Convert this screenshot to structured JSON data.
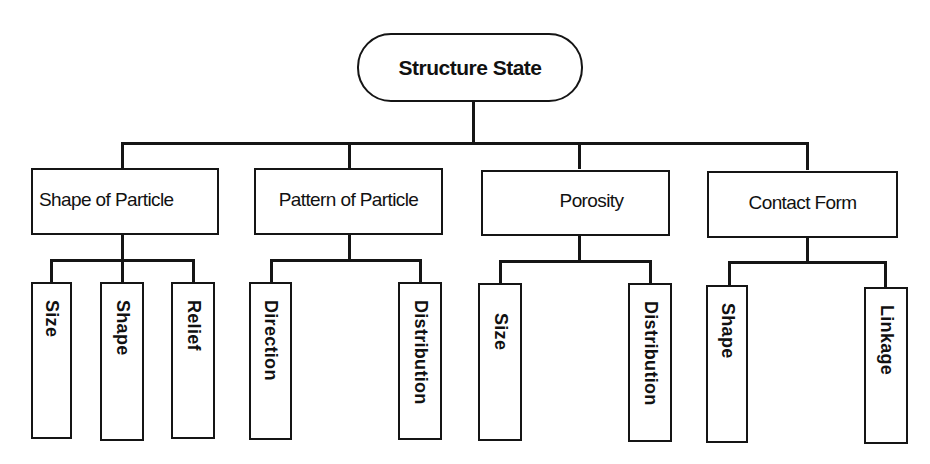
{
  "diagram": {
    "type": "hierarchy",
    "root": {
      "label": "Structure State"
    },
    "children": [
      {
        "label": "Shape of Particle",
        "children": [
          {
            "label": "Size"
          },
          {
            "label": "Shape"
          },
          {
            "label": "Relief"
          }
        ]
      },
      {
        "label": "Pattern of Particle",
        "children": [
          {
            "label": "Direction"
          },
          {
            "label": "Distribution"
          }
        ]
      },
      {
        "label": "Porosity",
        "children": [
          {
            "label": "Size"
          },
          {
            "label": "Distribution"
          }
        ]
      },
      {
        "label": "Contact Form",
        "children": [
          {
            "label": "Shape"
          },
          {
            "label": "Linkage"
          }
        ]
      }
    ]
  },
  "colors": {
    "line": "#151515",
    "background": "#ffffff"
  }
}
